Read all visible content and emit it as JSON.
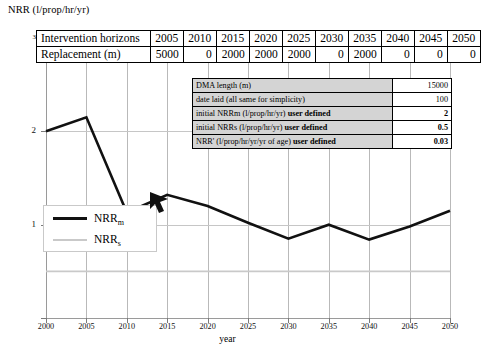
{
  "chart_data": {
    "type": "line",
    "title": "",
    "ylabel": "NRR (l/prop/hr/yr)",
    "xlabel": "year",
    "xlim": [
      2000,
      2050
    ],
    "ylim": [
      0,
      3
    ],
    "xticks": [
      2000,
      2005,
      2010,
      2015,
      2020,
      2025,
      2030,
      2035,
      2040,
      2045,
      2050
    ],
    "yticks": [
      0,
      1,
      2,
      3
    ],
    "ytick_labels": [
      "",
      "1",
      "2",
      "3"
    ],
    "grid": true,
    "legend_position": "inside-left",
    "series": [
      {
        "name": "NRRm",
        "label": "NRR",
        "sub": "m",
        "color": "#111111",
        "width": 2.6,
        "x": [
          2000,
          2005,
          2010,
          2015,
          2020,
          2025,
          2030,
          2035,
          2040,
          2045,
          2050
        ],
        "values": [
          2.0,
          2.15,
          1.13,
          1.32,
          1.2,
          1.02,
          0.85,
          1.0,
          0.84,
          0.98,
          1.15
        ]
      },
      {
        "name": "NRRs",
        "label": "NRR",
        "sub": "s",
        "color": "#c9c9c9",
        "width": 1.6,
        "x": [
          2000,
          2050
        ],
        "values": [
          0.5,
          0.5
        ]
      }
    ]
  },
  "horizons_table": {
    "rows": [
      {
        "header": "Intervention horizons",
        "cells": [
          "2005",
          "2010",
          "2015",
          "2020",
          "2025",
          "2030",
          "2035",
          "2040",
          "2045",
          "2050"
        ],
        "align": "yr"
      },
      {
        "header": "Replacement (m)",
        "cells": [
          "5000",
          "0",
          "2000",
          "2000",
          "2000",
          "0",
          "2000",
          "0",
          "0",
          "0"
        ],
        "align": "num"
      }
    ]
  },
  "params_table": {
    "rows": [
      {
        "label": "DMA length (m)",
        "note": "",
        "value": "15000",
        "bold": false
      },
      {
        "label": "date laid (all same for simplicity)",
        "note": "",
        "value": "100",
        "bold": false
      },
      {
        "label": "initial NRRm (l/prop/hr/yr)",
        "note": "user defined",
        "value": "2",
        "bold": true
      },
      {
        "label": "initial NRRs (l/prop/hr/yr)",
        "note": "user defined",
        "value": "0.5",
        "bold": true
      },
      {
        "label": "NRR' (l/prop/hr/yr/yr of age)",
        "note": "user defined",
        "value": "0.03",
        "bold": true
      }
    ]
  },
  "legend": {
    "items": [
      {
        "label": "NRR",
        "sub": "m",
        "color": "#111111",
        "thick": true
      },
      {
        "label": "NRR",
        "sub": "s",
        "color": "#c9c9c9",
        "thick": false
      }
    ]
  }
}
